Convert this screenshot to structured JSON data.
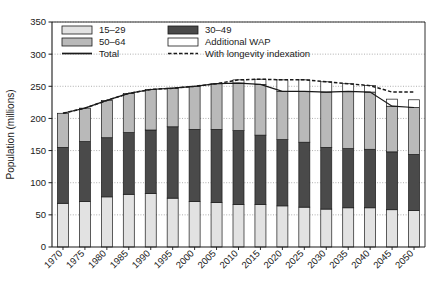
{
  "chart_data": {
    "type": "bar",
    "stacked": true,
    "title": "",
    "xlabel": "",
    "ylabel": "Population (millions)",
    "ylim": [
      0,
      350
    ],
    "yticks": [
      0,
      50,
      100,
      150,
      200,
      250,
      300,
      350
    ],
    "grid": true,
    "legend_position": "top-left-inside",
    "categories": [
      "1970",
      "1975",
      "1980",
      "1985",
      "1990",
      "1995",
      "2000",
      "2005",
      "2010",
      "2015",
      "2020",
      "2025",
      "2030",
      "2035",
      "2040",
      "2045",
      "2050"
    ],
    "series": [
      {
        "name": "15–29",
        "color": "#e2e2e2",
        "values": [
          68,
          71,
          78,
          82,
          83,
          76,
          71,
          69,
          66,
          66,
          64,
          62,
          59,
          61,
          61,
          58,
          57
        ]
      },
      {
        "name": "30–49",
        "color": "#4a4a4a",
        "values": [
          87,
          93,
          92,
          96,
          99,
          111,
          112,
          114,
          115,
          108,
          103,
          101,
          96,
          92,
          91,
          90,
          87
        ]
      },
      {
        "name": "50–64",
        "color": "#b9b9b9",
        "values": [
          53,
          52,
          58,
          61,
          63,
          60,
          67,
          71,
          74,
          79,
          75,
          79,
          86,
          89,
          89,
          71,
          73
        ]
      },
      {
        "name": "Additional WAP",
        "color": "#ffffff",
        "values": [
          0,
          0,
          0,
          0,
          0,
          0,
          0,
          0,
          5,
          8,
          18,
          18,
          16,
          12,
          10,
          11,
          12
        ]
      }
    ],
    "lines": [
      {
        "name": "Total",
        "style": "solid",
        "color": "#1a1a1a",
        "values": [
          208,
          216,
          228,
          239,
          245,
          247,
          250,
          254,
          255,
          253,
          242,
          242,
          241,
          242,
          241,
          219,
          217
        ]
      },
      {
        "name": "With longevity indexation",
        "style": "dashed",
        "color": "#1a1a1a",
        "values": [
          208,
          216,
          228,
          239,
          245,
          247,
          250,
          254,
          260,
          261,
          260,
          260,
          257,
          254,
          251,
          241,
          241
        ]
      }
    ]
  },
  "legend": {
    "items": [
      {
        "label": "15–29",
        "swatch": "light-gray-swatch",
        "kind": "box"
      },
      {
        "label": "30–49",
        "swatch": "dark-gray-swatch",
        "kind": "box"
      },
      {
        "label": "50–64",
        "swatch": "medium-gray-swatch",
        "kind": "box"
      },
      {
        "label": "Additional WAP",
        "swatch": "white-swatch",
        "kind": "box"
      },
      {
        "label": "Total",
        "swatch": "solid-line-swatch",
        "kind": "line-solid"
      },
      {
        "label": "With longevity indexation",
        "swatch": "dashed-line-swatch",
        "kind": "line-dashed"
      }
    ]
  },
  "axes": {
    "y_title": "Population (millions)",
    "y_tick_labels": [
      "0",
      "50",
      "100",
      "150",
      "200",
      "250",
      "300",
      "350"
    ],
    "x_tick_labels": [
      "1970",
      "1975",
      "1980",
      "1985",
      "1990",
      "1995",
      "2000",
      "2005",
      "2010",
      "2015",
      "2020",
      "2025",
      "2030",
      "2035",
      "2040",
      "2045",
      "2050"
    ]
  },
  "colors": {
    "age_15_29": "#e2e2e2",
    "age_30_49": "#4a4a4a",
    "age_50_64": "#b9b9b9",
    "additional_wap": "#ffffff",
    "axis": "#1a1a1a",
    "grid": "#9a9a9a",
    "background": "#ffffff"
  }
}
